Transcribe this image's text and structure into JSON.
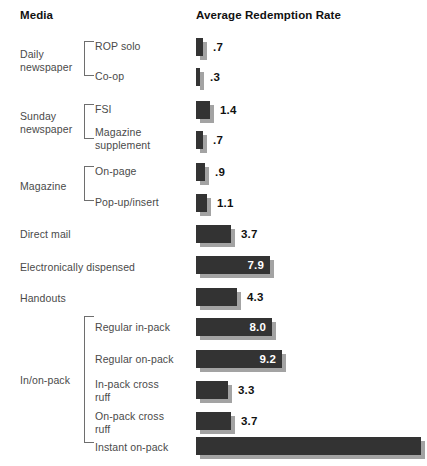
{
  "header": {
    "media_label": "Media",
    "rate_label": "Average Redemption Rate"
  },
  "chart_data": {
    "type": "bar",
    "title": "Average Redemption Rate",
    "xlabel": "Average Redemption Rate",
    "ylabel": "Media",
    "orientation": "horizontal",
    "grid": false,
    "legend": false,
    "axis_visible": false,
    "value_unit": "percent",
    "xlim": [
      0,
      9.6
    ],
    "px_per_unit": 9.4,
    "bar_origin_px": 196,
    "categories": [
      "ROP solo",
      "Co-op",
      "FSI",
      "Magazine supplement",
      "On-page",
      "Pop-up/insert",
      "Direct mail",
      "Electronically dispensed",
      "Handouts",
      "Regular in-pack",
      "Regular on-pack",
      "In-pack cross ruff",
      "On-pack cross ruff",
      "Instant on-pack"
    ],
    "values": [
      0.7,
      0.3,
      1.4,
      0.7,
      0.9,
      1.1,
      3.7,
      7.9,
      4.3,
      8.0,
      9.2,
      3.3,
      3.7,
      null
    ],
    "value_labels": [
      ".7",
      ".3",
      "1.4",
      ".7",
      ".9",
      "1.1",
      "3.7",
      "7.9",
      "4.3",
      "8.0",
      "9.2",
      "3.3",
      "3.7",
      ""
    ],
    "groups": [
      {
        "name": "Daily newspaper",
        "members": [
          "ROP solo",
          "Co-op"
        ]
      },
      {
        "name": "Sunday newspaper",
        "members": [
          "FSI",
          "Magazine supplement"
        ]
      },
      {
        "name": "Magazine",
        "members": [
          "On-page",
          "Pop-up/insert"
        ]
      },
      {
        "name": "",
        "members": [
          "Direct mail",
          "Electronically dispensed",
          "Handouts"
        ]
      },
      {
        "name": "In/on-pack",
        "members": [
          "Regular in-pack",
          "Regular on-pack",
          "In-pack cross ruff",
          "On-pack cross ruff",
          "Instant on-pack"
        ]
      }
    ],
    "colors": {
      "bar": "#333333",
      "shadow": "#a3a3a3",
      "inside_label": "#ffffff",
      "outside_label": "#111111"
    }
  },
  "groups": [
    {
      "name": "group-daily",
      "label": "Daily\nnewspaper",
      "top": 48,
      "bracket_top": 41,
      "bracket_height": 35
    },
    {
      "name": "group-sunday",
      "label": "Sunday\nnewspaper",
      "top": 110,
      "bracket_top": 104,
      "bracket_height": 35
    },
    {
      "name": "group-magazine",
      "label": "Magazine",
      "top": 180,
      "bracket_top": 166,
      "bracket_height": 35
    },
    {
      "name": "group-inonpack",
      "label": "In/on-pack",
      "top": 374,
      "bracket_top": 316,
      "bracket_height": 127
    }
  ],
  "rows": [
    {
      "name": "row-rop-solo",
      "label": "ROP solo",
      "label_top": 40,
      "lead": true,
      "bar_top": 38,
      "value": ".7",
      "width": 7,
      "inside": false
    },
    {
      "name": "row-co-op",
      "label": "Co-op",
      "label_top": 70,
      "lead": true,
      "bar_top": 68,
      "value": ".3",
      "width": 4,
      "inside": false
    },
    {
      "name": "row-fsi",
      "label": "FSI",
      "label_top": 103,
      "lead": true,
      "bar_top": 101,
      "value": "1.4",
      "width": 14,
      "inside": false
    },
    {
      "name": "row-magazine-supplement",
      "label": "Magazine\nsupplement",
      "label_top": 126,
      "lead": true,
      "bar_top": 131,
      "value": ".7",
      "width": 7,
      "inside": false
    },
    {
      "name": "row-on-page",
      "label": "On-page",
      "label_top": 165,
      "lead": true,
      "bar_top": 163,
      "value": ".9",
      "width": 9,
      "inside": false
    },
    {
      "name": "row-pop-up-insert",
      "label": "Pop-up/insert",
      "label_top": 196,
      "lead": true,
      "bar_top": 194,
      "value": "1.1",
      "width": 11,
      "inside": false
    },
    {
      "name": "row-direct-mail",
      "label": "Direct mail",
      "label_top": 228,
      "lead": false,
      "bar_top": 225,
      "value": "3.7",
      "width": 35,
      "inside": false
    },
    {
      "name": "row-electronically-dispensed",
      "label": "Electronically dispensed",
      "label_top": 261,
      "lead": false,
      "bar_top": 256,
      "value": "7.9",
      "width": 74,
      "inside": true
    },
    {
      "name": "row-handouts",
      "label": "Handouts",
      "label_top": 292,
      "lead": false,
      "bar_top": 288,
      "value": "4.3",
      "width": 41,
      "inside": false
    },
    {
      "name": "row-regular-in-pack",
      "label": "Regular in-pack",
      "label_top": 321,
      "lead": true,
      "bar_top": 318,
      "value": "8.0",
      "width": 76,
      "inside": true
    },
    {
      "name": "row-regular-on-pack",
      "label": "Regular on-pack",
      "label_top": 353,
      "lead": true,
      "bar_top": 350,
      "value": "9.2",
      "width": 86,
      "inside": true
    },
    {
      "name": "row-in-pack-cross-ruff",
      "label": "In-pack cross\nruff",
      "label_top": 378,
      "lead": true,
      "bar_top": 381,
      "value": "3.3",
      "width": 32,
      "inside": false
    },
    {
      "name": "row-on-pack-cross-ruff",
      "label": "On-pack cross\nruff",
      "label_top": 410,
      "lead": true,
      "bar_top": 412,
      "value": "3.7",
      "width": 35,
      "inside": false
    },
    {
      "name": "row-instant-on-pack",
      "label": "Instant on-pack",
      "label_top": 441,
      "lead": true,
      "bar_top": 437,
      "value": "",
      "width": 225,
      "inside": false
    }
  ]
}
